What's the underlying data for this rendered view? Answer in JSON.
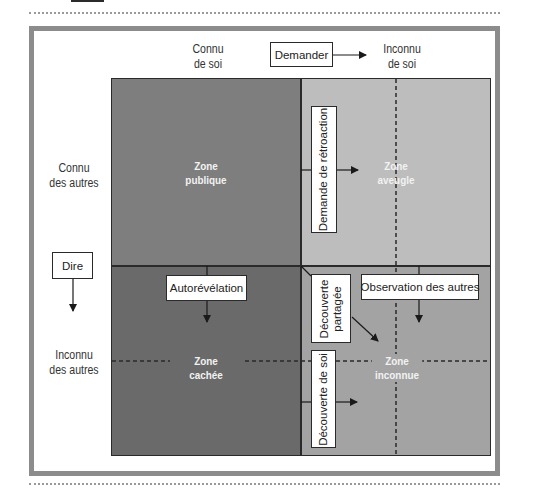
{
  "diagram": {
    "type": "johari-window",
    "columns": [
      {
        "label_line1": "Connu",
        "label_line2": "de soi"
      },
      {
        "label_line1": "Inconnu",
        "label_line2": "de soi"
      }
    ],
    "rows": [
      {
        "label_line1": "Connu",
        "label_line2": "des autres"
      },
      {
        "label_line1": "Inconnu",
        "label_line2": "des autres"
      }
    ],
    "zones": {
      "public": {
        "line1": "Zone",
        "line2": "publique",
        "color": "#7e7e7e"
      },
      "blind": {
        "line1": "Zone",
        "line2": "aveugle",
        "color": "#bdbdbd"
      },
      "hidden": {
        "line1": "Zone",
        "line2": "cachée",
        "color": "#6a6a6a"
      },
      "unknown": {
        "line1": "Zone",
        "line2": "inconnue",
        "color": "#a3a3a3"
      }
    },
    "actions": {
      "ask": "Demander",
      "tell": "Dire",
      "feedback_request": "Demande de rétroaction",
      "self_disclosure": "Autorévélation",
      "shared_discovery_line1": "Découverte",
      "shared_discovery_line2": "partagée",
      "others_observation": "Observation des autres",
      "self_discovery": "Découverte de soi"
    }
  }
}
